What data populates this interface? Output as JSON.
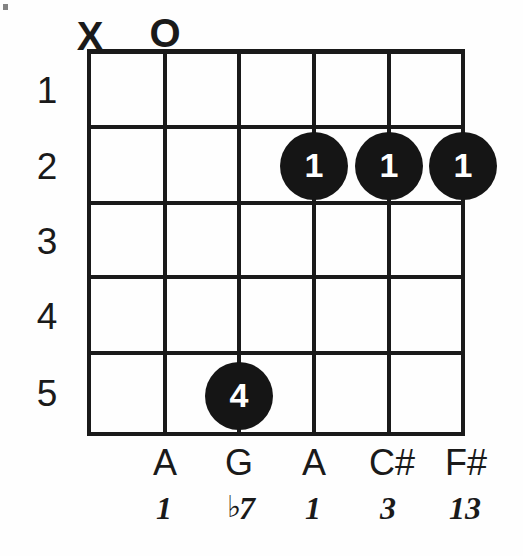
{
  "diagram": {
    "type": "guitar-chord-diagram",
    "string_count": 6,
    "fret_count": 5,
    "fret_numbers": [
      "1",
      "2",
      "3",
      "4",
      "5"
    ],
    "open_muted_markers": [
      {
        "string": 1,
        "symbol": "X",
        "meaning": "muted"
      },
      {
        "string": 2,
        "symbol": "O",
        "meaning": "open"
      }
    ],
    "finger_dots": [
      {
        "string": 3,
        "fret": 5,
        "finger": "4"
      },
      {
        "string": 4,
        "fret": 2,
        "finger": "1"
      },
      {
        "string": 5,
        "fret": 2,
        "finger": "1"
      },
      {
        "string": 6,
        "fret": 2,
        "finger": "1"
      }
    ],
    "note_names": [
      {
        "string": 2,
        "name": "A"
      },
      {
        "string": 3,
        "name": "G"
      },
      {
        "string": 4,
        "name": "A"
      },
      {
        "string": 5,
        "name": "C#"
      },
      {
        "string": 6,
        "name": "F#"
      }
    ],
    "intervals": [
      {
        "string": 2,
        "flat": "",
        "degree": "1"
      },
      {
        "string": 3,
        "flat": "♭",
        "degree": "7"
      },
      {
        "string": 4,
        "flat": "",
        "degree": "1"
      },
      {
        "string": 5,
        "flat": "",
        "degree": "3"
      },
      {
        "string": 6,
        "flat": "",
        "degree": "13"
      }
    ],
    "colors": {
      "ink": "#1a1a1a",
      "dot_fill": "#151515",
      "dot_text": "#ffffff",
      "background": "#fefefe"
    }
  }
}
